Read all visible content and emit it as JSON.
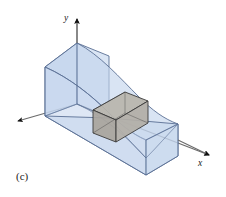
{
  "figure": {
    "caption": "(c)",
    "background_color": "#ffffff",
    "axes": {
      "y_label": "y",
      "x_label": "x",
      "z_label": "",
      "axis_color": "#6b6b6b",
      "arrow_color": "#111111",
      "origin": {
        "x": 77,
        "y": 104
      },
      "y_tip": {
        "x": 77,
        "y": 14
      },
      "x_tip": {
        "x": 214,
        "y": 157
      },
      "z_tip": {
        "x": 13,
        "y": 124
      }
    },
    "solid": {
      "name": "curved-top-solid",
      "fill_color": "#c2d4ec",
      "fill_opacity": 0.72,
      "edge_color": "#5a6f94",
      "top_surface_shape": "curved-decreasing-in-x",
      "description": "translucent blue solid region under a curved surface"
    },
    "volume_element": {
      "name": "gray-volume-box",
      "fill_color": "#b4b0a8",
      "fill_opacity": 0.92,
      "edge_color": "#3a3a3a",
      "description": "shaded rectangular prism element inside the solid"
    }
  }
}
